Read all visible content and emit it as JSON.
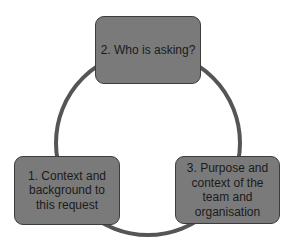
{
  "diagram": {
    "type": "cycle",
    "ring_color": "#555555",
    "box_fill": "#7a7a7a",
    "steps": [
      {
        "label": "1.  Context and background to this request"
      },
      {
        "label": "2. Who is asking?"
      },
      {
        "label": "3.  Purpose and context of the team and organisation"
      }
    ]
  }
}
